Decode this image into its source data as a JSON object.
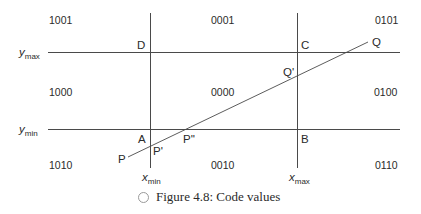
{
  "diagram": {
    "region_codes": {
      "top_left": "1001",
      "top_center": "0001",
      "top_right": "0101",
      "middle_left": "1000",
      "middle_center": "0000",
      "middle_right": "0100",
      "bottom_left": "1010",
      "bottom_center": "0010",
      "bottom_right": "0110"
    },
    "corners": {
      "A": "A",
      "B": "B",
      "C": "C",
      "D": "D"
    },
    "points": {
      "P": "P",
      "P_prime": "P'",
      "P_double_prime": "P''",
      "Q": "Q",
      "Q_prime": "Q'"
    },
    "axes": {
      "ymax_var": "y",
      "ymax_sub": "max",
      "ymin_var": "y",
      "ymin_sub": "min",
      "xmin_var": "x",
      "xmin_sub": "min",
      "xmax_var": "x",
      "xmax_sub": "max"
    },
    "line_color": "#4a4a4a"
  },
  "caption": {
    "icon": "circle-icon",
    "text": "Figure 4.8:  Code values"
  }
}
